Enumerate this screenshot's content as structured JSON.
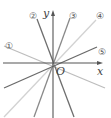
{
  "diagram": {
    "type": "coordinate-plane-lines",
    "axes": {
      "x_label": "x",
      "y_label": "y",
      "origin_label": "O"
    },
    "lines": [
      {
        "label": "①",
        "color": "#bdbdbd",
        "x1": 4,
        "y1": 46,
        "x2": 105,
        "y2": 88,
        "lx": 9,
        "ly": 46
      },
      {
        "label": "②",
        "color": "#6e6e6e",
        "x1": 37,
        "y1": 19,
        "x2": 74,
        "y2": 117,
        "lx": 33,
        "ly": 16
      },
      {
        "label": "③",
        "color": "#8a8a8a",
        "x1": 70,
        "y1": 18,
        "x2": 34,
        "y2": 117,
        "lx": 73,
        "ly": 16
      },
      {
        "label": "④",
        "color": "#d2d2d2",
        "x1": 96,
        "y1": 20,
        "x2": 4,
        "y2": 117,
        "lx": 100,
        "ly": 16
      },
      {
        "label": "⑤",
        "color": "#6a6a6a",
        "x1": 97,
        "y1": 47,
        "x2": 4,
        "y2": 88,
        "lx": 102,
        "ly": 52
      }
    ]
  }
}
